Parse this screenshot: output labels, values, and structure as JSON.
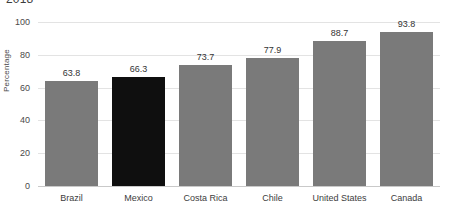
{
  "chart_data": {
    "type": "bar",
    "title": "2018",
    "subtitle": "",
    "xlabel": "",
    "ylabel": "Percentage",
    "categories": [
      "Brazil",
      "Mexico",
      "Costa Rica",
      "Chile",
      "United States",
      "Canada"
    ],
    "values": [
      63.8,
      66.3,
      73.7,
      77.9,
      88.7,
      93.8
    ],
    "value_labels": [
      "63.8",
      "66.3",
      "73.7",
      "77.9",
      "88.7",
      "93.8"
    ],
    "ylim": [
      0,
      100
    ],
    "yticks": [
      0,
      20,
      40,
      60,
      80,
      100
    ],
    "ytick_labels": [
      "0",
      "20",
      "40",
      "60",
      "80",
      "100"
    ],
    "grid": true,
    "grid_axis": "y",
    "legend": false,
    "legend_position": "none",
    "highlight_category": "Mexico",
    "colors": {
      "bar": "#7a7a7a",
      "bar_highlight": "#0f0f0f",
      "gridline": "#e3e3e3",
      "baseline": "#c9c9c9",
      "tick_text": "#4a4a4a",
      "value_text": "#333333",
      "background": "#ffffff"
    }
  }
}
